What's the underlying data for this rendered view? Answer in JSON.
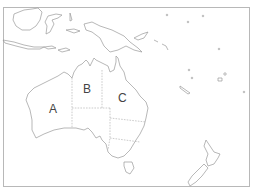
{
  "map": {
    "region": "Australia and Oceania",
    "labels": [
      {
        "id": "A",
        "text": "A"
      },
      {
        "id": "B",
        "text": "B"
      },
      {
        "id": "C",
        "text": "C"
      }
    ],
    "colors": {
      "outline": "#9a9a9a",
      "frame": "#b8b8b8",
      "background": "#ffffff"
    }
  }
}
